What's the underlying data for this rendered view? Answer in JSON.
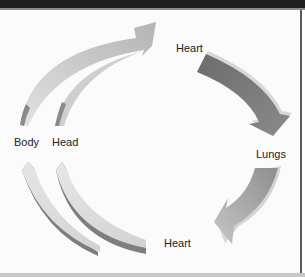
{
  "diagram": {
    "type": "circulation-cycle",
    "labels": {
      "heart_top": "Heart",
      "lungs": "Lungs",
      "heart_bottom": "Heart",
      "body": "Body",
      "head": "Head"
    },
    "arrows": [
      {
        "id": "heart-to-lungs",
        "from": "Heart",
        "to": "Lungs",
        "color": "#7a7a7a"
      },
      {
        "id": "lungs-to-heart",
        "from": "Lungs",
        "to": "Heart",
        "color": "#a8a8a8"
      },
      {
        "id": "heart-to-body",
        "from": "Heart",
        "to": "Body",
        "color": "#dedede"
      },
      {
        "id": "heart-to-head",
        "from": "Heart",
        "to": "Head",
        "color": "#dedede"
      },
      {
        "id": "body-to-heart",
        "from": "Body",
        "to": "Heart",
        "color": "#bdbdbd"
      },
      {
        "id": "head-to-heart",
        "from": "Head",
        "to": "Heart",
        "color": "#bdbdbd"
      }
    ],
    "colors": {
      "dark_arrow": "#7a7a7a",
      "mid_arrow": "#a8a8a8",
      "light_arrow": "#dcdcdc",
      "shadow": "#8c8c8c"
    }
  }
}
